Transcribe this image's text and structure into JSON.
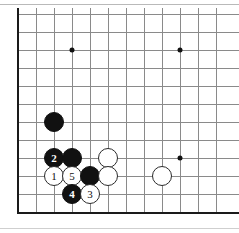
{
  "diagram": {
    "board": {
      "view": "bottom-left corner",
      "grid_spacing_px": 18,
      "origin_x_px": 18,
      "origin_y_px": 14,
      "columns": 12,
      "rows": 12,
      "line_color": "#8a8a8a",
      "edge_color": "#1a1a1a",
      "background_color": "#ffffff"
    },
    "star_points": [
      {
        "name": "star-point-upper-left",
        "x": 72,
        "y": 50
      },
      {
        "name": "star-point-upper-right",
        "x": 180,
        "y": 50
      },
      {
        "name": "star-point-lower-right",
        "x": 180,
        "y": 158
      }
    ],
    "stones": [
      {
        "id": "black-stone-plain-1",
        "color": "black",
        "label": "",
        "x": 54,
        "y": 122,
        "d": 20
      },
      {
        "id": "black-stone-move-2",
        "color": "black",
        "label": "2",
        "x": 54,
        "y": 158,
        "d": 20
      },
      {
        "id": "black-stone-plain-2",
        "color": "black",
        "label": "",
        "x": 72,
        "y": 158,
        "d": 20
      },
      {
        "id": "white-stone-plain-1",
        "color": "white",
        "label": "",
        "x": 108,
        "y": 158,
        "d": 20
      },
      {
        "id": "white-stone-move-1",
        "color": "white",
        "label": "1",
        "x": 54,
        "y": 176,
        "d": 20
      },
      {
        "id": "white-stone-move-5",
        "color": "white",
        "label": "5",
        "x": 72,
        "y": 176,
        "d": 20
      },
      {
        "id": "black-stone-plain-3",
        "color": "black",
        "label": "",
        "x": 90,
        "y": 176,
        "d": 20
      },
      {
        "id": "white-stone-plain-2",
        "color": "white",
        "label": "",
        "x": 108,
        "y": 176,
        "d": 20
      },
      {
        "id": "white-stone-plain-3",
        "color": "white",
        "label": "",
        "x": 162,
        "y": 176,
        "d": 20
      },
      {
        "id": "black-stone-move-4",
        "color": "black",
        "label": "4",
        "x": 72,
        "y": 194,
        "d": 20
      },
      {
        "id": "white-stone-move-3",
        "color": "white",
        "label": "3",
        "x": 90,
        "y": 194,
        "d": 20
      }
    ],
    "move_sequence": [
      "1",
      "2",
      "3",
      "4",
      "5"
    ]
  }
}
